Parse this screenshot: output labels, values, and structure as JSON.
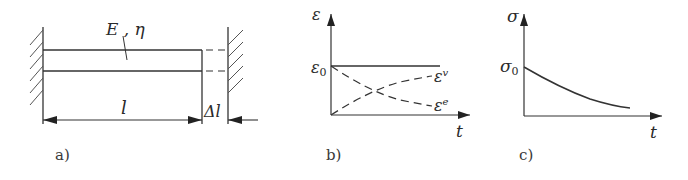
{
  "panels": {
    "a": {
      "caption": "a)",
      "material_label": "E , η",
      "length_label": "l",
      "elongation_label": "Δl"
    },
    "b": {
      "caption": "b)",
      "y_axis_label": "ε",
      "x_axis_label": "t",
      "level_label": "ε",
      "level_sub": "0",
      "curve_v_label": "ε",
      "curve_v_sup": "v",
      "curve_e_label": "ε",
      "curve_e_sup": "e"
    },
    "c": {
      "caption": "c)",
      "y_axis_label": "σ",
      "x_axis_label": "t",
      "level_label": "σ",
      "level_sub": "0"
    }
  },
  "colors": {
    "line": "#333333",
    "hatch": "#555555"
  }
}
